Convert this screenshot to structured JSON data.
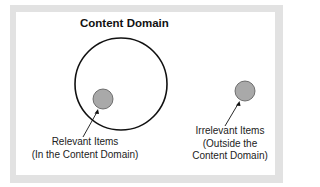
{
  "diagram": {
    "title": "Content Domain",
    "relevant": {
      "line1": "Relevant Items",
      "line2": "(In the Content Domain)"
    },
    "irrelevant": {
      "line1": "Irrelevant Items",
      "line2": "(Outside the",
      "line3": "Content Domain)"
    },
    "colors": {
      "frame": "#e2e2e2",
      "item_fill": "#a9a9a9",
      "outline": "#111111"
    }
  }
}
